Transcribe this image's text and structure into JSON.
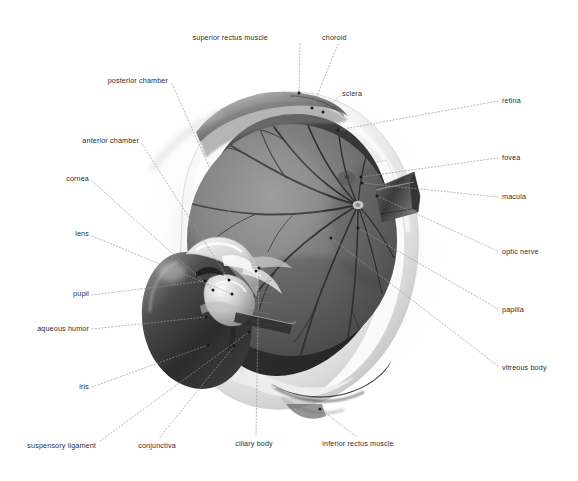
{
  "figure": {
    "style": "grayscale airbrush medical illustration",
    "background_color": "#ffffff",
    "label_color": "#2e2e2e",
    "leader_line_color": "#9a9a9a",
    "anchor_dot_color": "#1a1a1a"
  },
  "labels": [
    {
      "id": "superior-rectus-muscle",
      "text": "superior rectus muscle",
      "align": "center",
      "x": 268,
      "y": 37,
      "anchor_x": 299,
      "anchor_y": 94,
      "side": "top"
    },
    {
      "id": "choroid",
      "text": "choroid",
      "align": "center",
      "x": 339,
      "y": 37,
      "anchor_x": 311,
      "anchor_y": 109,
      "side": "top"
    },
    {
      "id": "sclera",
      "text": "sclera",
      "align": "left",
      "x": 342,
      "y": 93,
      "anchor_x": 322,
      "anchor_y": 113,
      "side": "top"
    },
    {
      "id": "posterior-chamber",
      "text": "posterior chamber",
      "align": "right",
      "x": 168,
      "y": 80,
      "anchor_x": 255,
      "anchor_y": 272,
      "side": "left"
    },
    {
      "id": "anterior-chamber",
      "text": "anterior chamber",
      "align": "right",
      "x": 139,
      "y": 140,
      "anchor_x": 228,
      "anchor_y": 281,
      "side": "left"
    },
    {
      "id": "cornea",
      "text": "cornea",
      "align": "right",
      "x": 89,
      "y": 178,
      "anchor_x": 212,
      "anchor_y": 291,
      "side": "left"
    },
    {
      "id": "lens",
      "text": "lens",
      "align": "right",
      "x": 89,
      "y": 233,
      "anchor_x": 231,
      "anchor_y": 295,
      "side": "left"
    },
    {
      "id": "pupil",
      "text": "pupil",
      "align": "right",
      "x": 89,
      "y": 293,
      "anchor_x": 204,
      "anchor_y": 281,
      "side": "left"
    },
    {
      "id": "aqueous-humor",
      "text": "aqueous humor",
      "align": "right",
      "x": 89,
      "y": 328,
      "anchor_x": 205,
      "anchor_y": 318,
      "side": "left"
    },
    {
      "id": "iris",
      "text": "iris",
      "align": "right",
      "x": 89,
      "y": 386,
      "anchor_x": 207,
      "anchor_y": 345,
      "side": "left"
    },
    {
      "id": "suspensory-ligament",
      "text": "suspensory ligament",
      "align": "right",
      "x": 96,
      "y": 445,
      "anchor_x": 248,
      "anchor_y": 332,
      "side": "left"
    },
    {
      "id": "conjunctiva",
      "text": "conjunctiva",
      "align": "center",
      "x": 157,
      "y": 445,
      "anchor_x": 233,
      "anchor_y": 345,
      "side": "bottom"
    },
    {
      "id": "ciliary-body",
      "text": "ciliary body",
      "align": "center",
      "x": 254,
      "y": 443,
      "anchor_x": 258,
      "anchor_y": 268,
      "side": "bottom"
    },
    {
      "id": "inferior-rectus-muscle",
      "text": "inferior rectus muscle",
      "align": "center",
      "x": 358,
      "y": 443,
      "anchor_x": 319,
      "anchor_y": 410,
      "side": "bottom"
    },
    {
      "id": "retina",
      "text": "retina",
      "align": "left",
      "x": 502,
      "y": 100,
      "anchor_x": 337,
      "anchor_y": 130,
      "side": "right"
    },
    {
      "id": "fovea",
      "text": "fovea",
      "align": "left",
      "x": 502,
      "y": 157,
      "anchor_x": 360,
      "anchor_y": 177,
      "side": "right"
    },
    {
      "id": "macula",
      "text": "macula",
      "align": "left",
      "x": 502,
      "y": 196,
      "anchor_x": 361,
      "anchor_y": 183,
      "side": "right"
    },
    {
      "id": "optic-nerve",
      "text": "optic nerve",
      "align": "left",
      "x": 502,
      "y": 251,
      "anchor_x": 376,
      "anchor_y": 196,
      "side": "right"
    },
    {
      "id": "papilla",
      "text": "papilla",
      "align": "left",
      "x": 502,
      "y": 309,
      "anchor_x": 357,
      "anchor_y": 228,
      "side": "right"
    },
    {
      "id": "vitreous-body",
      "text": "vitreous body",
      "align": "left",
      "x": 502,
      "y": 367,
      "anchor_x": 330,
      "anchor_y": 238,
      "side": "right"
    }
  ],
  "structures": [
    {
      "id": "sclera-shell",
      "name": "sclera",
      "tone": "#f2f2f2"
    },
    {
      "id": "vitreous-globe",
      "name": "vitreous body",
      "tone": "#6e6e6e"
    },
    {
      "id": "choroid-rim",
      "name": "choroid",
      "tone": "#3a3a3a"
    },
    {
      "id": "iris-ring",
      "name": "iris",
      "tone": "#4a4a4a"
    },
    {
      "id": "lens-body",
      "name": "lens",
      "tone": "#d8d8d8"
    },
    {
      "id": "cornea-dome",
      "name": "cornea",
      "tone": "#e8e8e8"
    },
    {
      "id": "optic-nerve-stub",
      "name": "optic nerve",
      "tone": "#5a5a5a"
    },
    {
      "id": "superior-rectus",
      "name": "superior rectus muscle",
      "tone": "#8a8a8a"
    },
    {
      "id": "inferior-rectus",
      "name": "inferior rectus muscle",
      "tone": "#7a7a7a"
    },
    {
      "id": "retinal-vessels",
      "name": "retinal vessels",
      "tone": "#2a2a2a"
    }
  ]
}
